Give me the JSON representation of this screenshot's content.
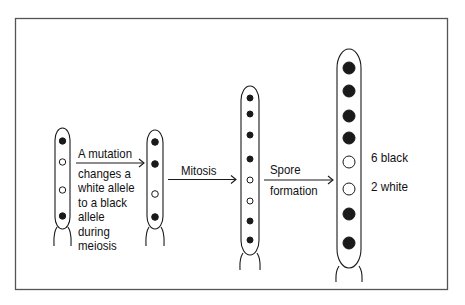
{
  "figure": {
    "colors": {
      "ink": "#1a1a1a",
      "frame": "#555555",
      "background": "#ffffff"
    }
  },
  "asci": [
    {
      "id": "meiosis-products",
      "spores": [
        "black",
        "white",
        "white",
        "black"
      ]
    },
    {
      "id": "after-mutation",
      "spores": [
        "black",
        "black",
        "white",
        "black"
      ]
    },
    {
      "id": "after-mitosis",
      "spores": [
        "black",
        "black",
        "black",
        "black",
        "white",
        "white",
        "black",
        "black"
      ]
    },
    {
      "id": "mature-ascus",
      "spores": [
        "black",
        "black",
        "black",
        "black",
        "white",
        "white",
        "black",
        "black"
      ]
    }
  ],
  "steps": [
    {
      "id": "mutation",
      "lines": [
        "A mutation",
        "changes a",
        "white allele",
        "to a black",
        "allele",
        "during",
        "meiosis"
      ]
    },
    {
      "id": "mitosis",
      "lines": [
        "Mitosis"
      ]
    },
    {
      "id": "spore-formation",
      "lines": [
        "Spore",
        "formation"
      ]
    }
  ],
  "result": {
    "black_label": "6 black",
    "white_label": "2 white"
  }
}
